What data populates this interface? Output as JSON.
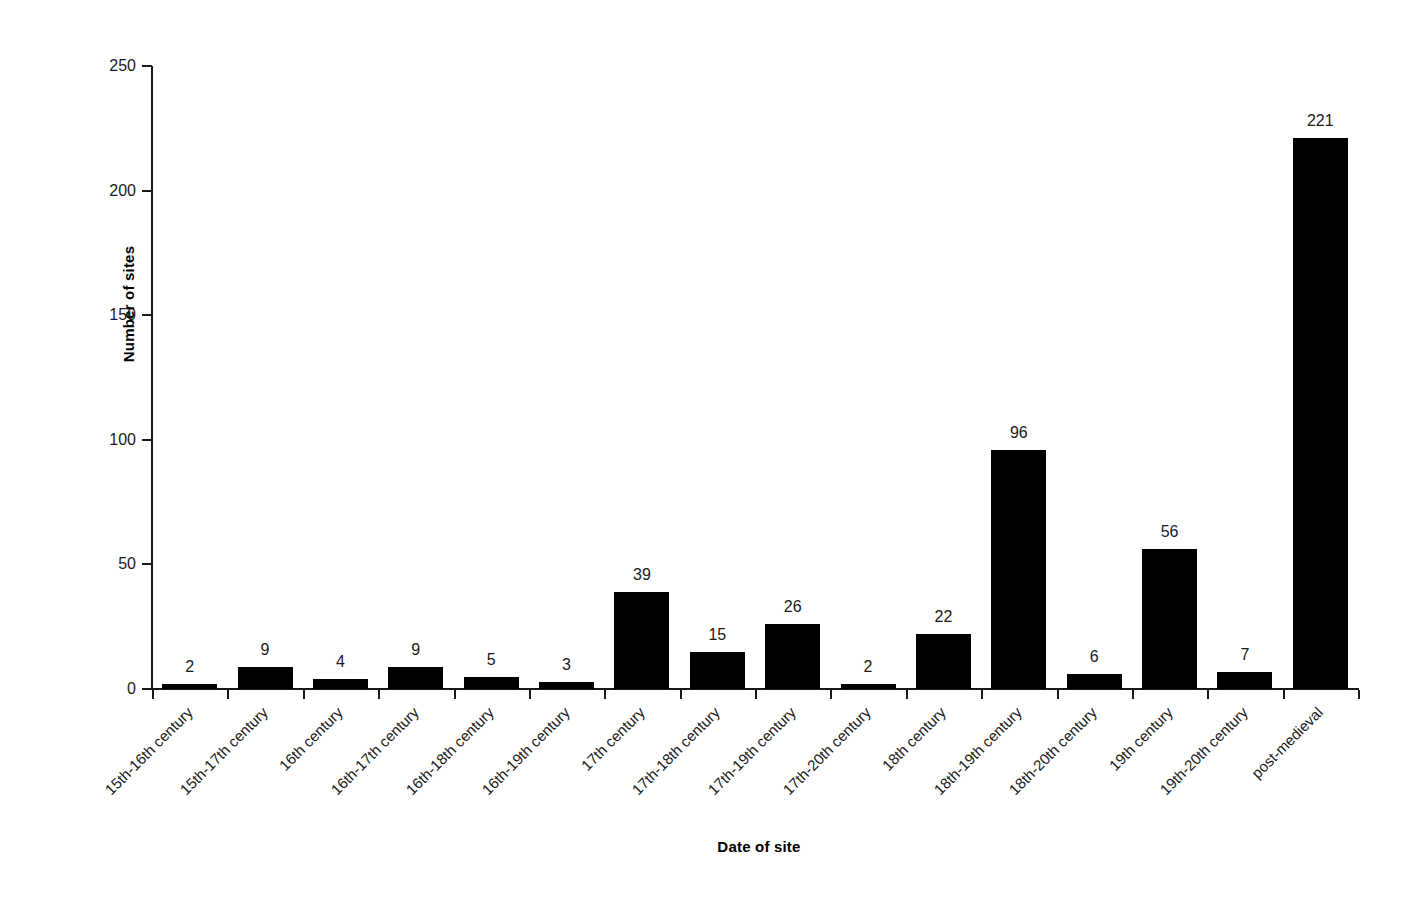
{
  "chart_data": {
    "type": "bar",
    "title": "",
    "subtitle": "",
    "xlabel": "Date of site",
    "ylabel": "Number of sites",
    "ylim": [
      0,
      250
    ],
    "yticks": [
      0,
      50,
      100,
      150,
      200,
      250
    ],
    "ytick_labels": [
      "0",
      "50",
      "100",
      "150",
      "200",
      "250"
    ],
    "grid": false,
    "legend": false,
    "legend_position": "none",
    "bar_color": "#000000",
    "axis_color": "#1a1a1a",
    "background_color": "#ffffff",
    "data_labels_shown": true,
    "categories": [
      "15th-16th century",
      "15th-17th century",
      "16th century",
      "16th-17th century",
      "16th-18th century",
      "16th-19th century",
      "17th century",
      "17th-18th century",
      "17th-19th century",
      "17th-20th century",
      "18th century",
      "18th-19th century",
      "18th-20th century",
      "19th century",
      "19th-20th century",
      "post-medieval"
    ],
    "values": [
      2,
      9,
      4,
      9,
      5,
      3,
      39,
      15,
      26,
      2,
      22,
      96,
      6,
      56,
      7,
      221
    ],
    "value_labels": [
      "2",
      "9",
      "4",
      "9",
      "5",
      "3",
      "39",
      "15",
      "26",
      "2",
      "22",
      "96",
      "6",
      "56",
      "7",
      "221"
    ]
  }
}
